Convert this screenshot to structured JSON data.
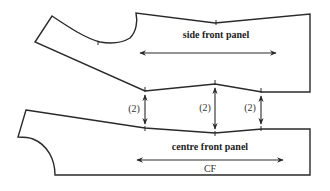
{
  "diagram": {
    "pieces": [
      {
        "id": "side-front-panel",
        "label": "side front panel"
      },
      {
        "id": "centre-front-panel",
        "label": "centre front panel",
        "fold_label": "CF"
      }
    ],
    "spacing_arrows": [
      {
        "label": "(2)"
      },
      {
        "label": "(2)"
      },
      {
        "label": "(2)"
      }
    ],
    "colors": {
      "line": "#2a2a2a",
      "background": "#ffffff"
    }
  }
}
